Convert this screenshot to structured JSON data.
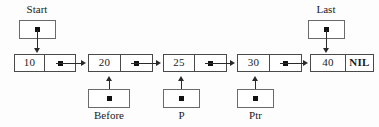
{
  "diagram": {
    "background_color": "#fdfdfd",
    "line_color": "#2a2a2a",
    "box_border_color": "#4a4a4a",
    "nodes": [
      {
        "data": "10",
        "link": "pointer-dot",
        "x": 14,
        "data_w": 29,
        "link_w": 30
      },
      {
        "data": "20",
        "link": "pointer-dot",
        "x": 88,
        "data_w": 31,
        "link_w": 31
      },
      {
        "data": "25",
        "link": "pointer-dot",
        "x": 163,
        "data_w": 30,
        "link_w": 31
      },
      {
        "data": "30",
        "link": "pointer-dot",
        "x": 237,
        "data_w": 31,
        "link_w": 31
      },
      {
        "data": "40",
        "link": "NIL",
        "x": 310,
        "data_w": 34,
        "link_w": 27
      }
    ],
    "pointers": [
      {
        "name": "Start",
        "label": "Start",
        "position": "above",
        "target_node_index": 0
      },
      {
        "name": "Last",
        "label": "Last",
        "position": "above",
        "target_node_index": 4
      },
      {
        "name": "Before",
        "label": "Before",
        "position": "below",
        "target_node_index": 1
      },
      {
        "name": "P",
        "label": "P",
        "position": "below",
        "target_node_index": 2
      },
      {
        "name": "Ptr",
        "label": "Ptr",
        "position": "below",
        "target_node_index": 3
      }
    ],
    "link_arrows": [
      {
        "from_node": 0,
        "to_node": 1
      },
      {
        "from_node": 1,
        "to_node": 2
      },
      {
        "from_node": 2,
        "to_node": 3
      },
      {
        "from_node": 3,
        "to_node": 4
      }
    ]
  }
}
